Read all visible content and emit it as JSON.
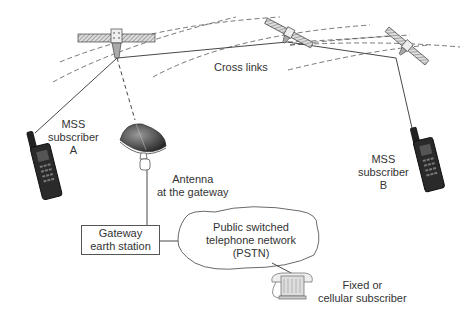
{
  "diagram": {
    "type": "mobile satellite service network",
    "nodes": {
      "satellites": [
        {
          "id": "sat-1",
          "label": ""
        },
        {
          "id": "sat-2",
          "label": ""
        },
        {
          "id": "sat-3",
          "label": ""
        }
      ],
      "cross_links": {
        "label": "Cross links"
      },
      "subscriber_a": {
        "lines": [
          "MSS",
          "subscriber",
          "A"
        ]
      },
      "subscriber_b": {
        "lines": [
          "MSS",
          "subscriber",
          "B"
        ]
      },
      "antenna": {
        "lines": [
          "Antenna",
          "at the gateway"
        ]
      },
      "gateway": {
        "lines": [
          "Gateway",
          "earth station"
        ]
      },
      "pstn": {
        "lines": [
          "Public switched",
          "telephone network",
          "(PSTN)"
        ]
      },
      "fixed_subscriber": {
        "lines": [
          "Fixed or",
          "cellular subscriber"
        ]
      }
    },
    "colors": {
      "line": "#333333",
      "dashed_orbit": "#555555",
      "text": "#333333",
      "background": "#ffffff"
    }
  }
}
